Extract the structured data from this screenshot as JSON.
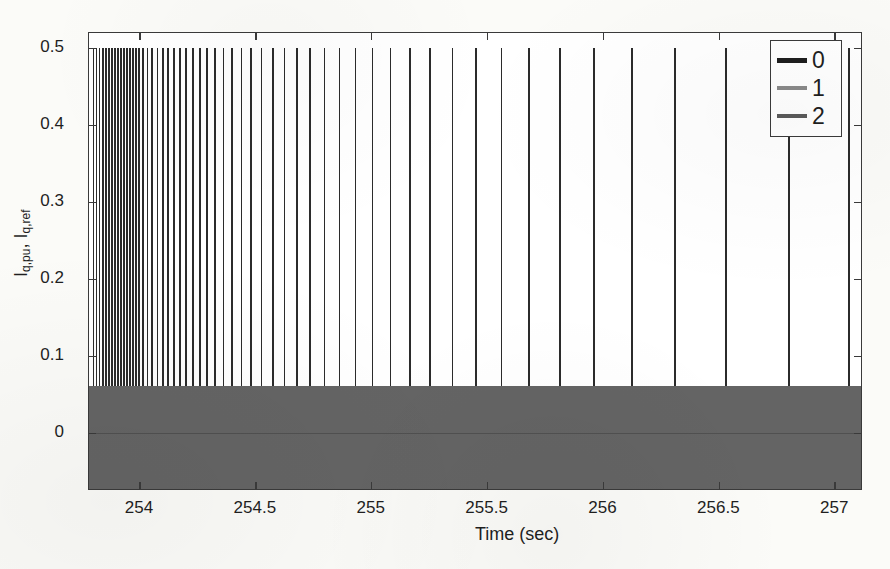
{
  "figure": {
    "background_color": "#fbfbf8",
    "plot_background_color": "#ffffff",
    "frame_color": "#3a3a3a"
  },
  "chart_data": {
    "type": "line",
    "title": "",
    "subtitle": "",
    "xlabel": "Time (sec)",
    "ylabel": "I_q,pu, I_q,ref",
    "ylabel_parts": {
      "base1": "I",
      "sub1": "q,pu",
      "sep": ", ",
      "base2": "I",
      "sub2": "q,ref"
    },
    "xlim": [
      253.78,
      257.12
    ],
    "ylim": [
      -0.075,
      0.52
    ],
    "xticks": [
      254,
      254.5,
      255,
      255.5,
      256,
      256.5,
      257
    ],
    "xticklabels": [
      "254",
      "254.5",
      "255",
      "255.5",
      "256",
      "256.5",
      "257"
    ],
    "yticks": [
      0,
      0.1,
      0.2,
      0.3,
      0.4,
      0.5
    ],
    "yticklabels": [
      "0",
      "0.1",
      "0.2",
      "0.3",
      "0.4",
      "0.5"
    ],
    "grid": false,
    "legend_position": "upper right",
    "legend": [
      {
        "label": "0",
        "color": "#1e1e1e",
        "linewidth": 5
      },
      {
        "label": "1",
        "color": "#8a8a8a",
        "linewidth": 4
      },
      {
        "label": "2",
        "color": "#5a5a5a",
        "linewidth": 4.5
      }
    ],
    "series": [
      {
        "name": "0",
        "color": "#2b2b2b",
        "kind": "spikes",
        "spike_top": 0.5,
        "spike_bottom": 0.06,
        "x": [
          253.8,
          253.813,
          253.826,
          253.839,
          253.852,
          253.865,
          253.878,
          253.891,
          253.904,
          253.917,
          253.93,
          253.943,
          253.956,
          253.969,
          253.982,
          253.995,
          254.012,
          254.032,
          254.053,
          254.075,
          254.098,
          254.122,
          254.147,
          254.173,
          254.2,
          254.228,
          254.258,
          254.29,
          254.324,
          254.36,
          254.398,
          254.438,
          254.48,
          254.525,
          254.573,
          254.624,
          254.678,
          254.735,
          254.796,
          254.861,
          254.93,
          255.003,
          255.081,
          255.164,
          255.253,
          255.348,
          255.45,
          255.56,
          255.68,
          255.812,
          255.958,
          256.122,
          256.31,
          256.53,
          256.8,
          257.06
        ]
      },
      {
        "name": "zero-band",
        "color": "#646464",
        "kind": "dense-oscillation",
        "y_min": -0.072,
        "y_max": 0.062,
        "x_start": 253.78,
        "x_end": 257.12
      }
    ]
  },
  "axes": {
    "x_axis_name": "time-axis",
    "y_axis_name": "current-axis"
  }
}
